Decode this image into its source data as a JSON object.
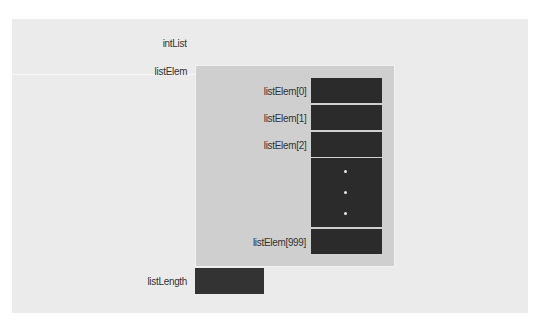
{
  "diagram": {
    "title_var": "intList",
    "member_array": "listElem",
    "member_length": "listLength",
    "elements": [
      {
        "label": "listElem[0]"
      },
      {
        "label": "listElem[1]"
      },
      {
        "label": "listElem[2]"
      },
      {
        "label": "listElem[999]"
      }
    ],
    "ellipsis": "⋮",
    "colors": {
      "panel": "#ebebeb",
      "struct": "#cfcfcf",
      "cell": "#2b2b2b"
    }
  }
}
